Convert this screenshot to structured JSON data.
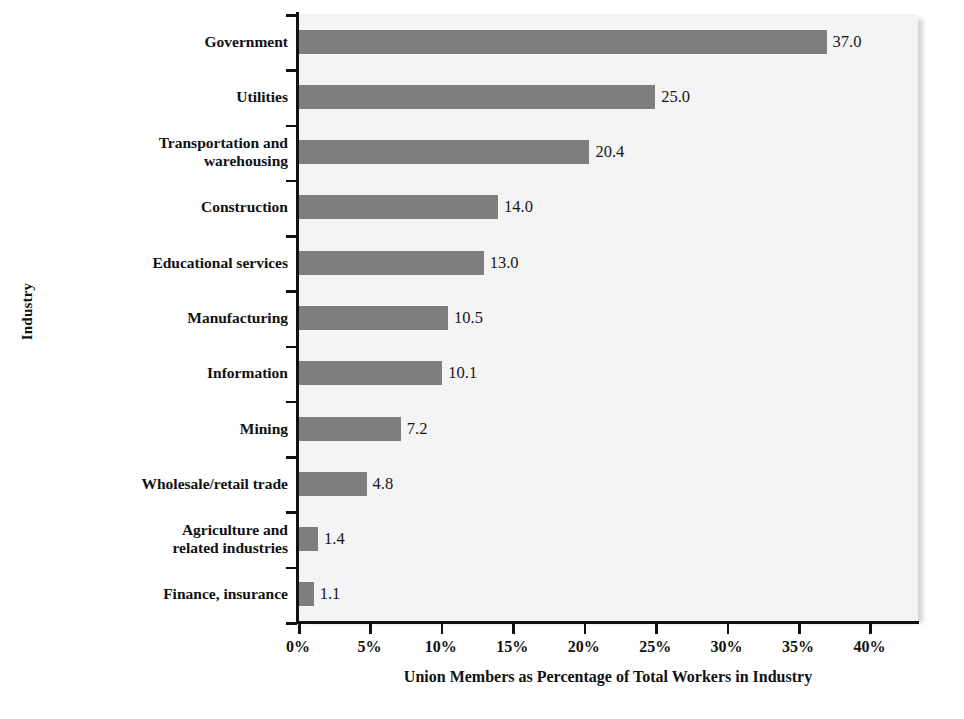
{
  "chart_data": {
    "type": "bar",
    "orientation": "horizontal",
    "title": "",
    "xlabel": "Union Members as Percentage of Total Workers in Industry",
    "ylabel": "Industry",
    "categories": [
      "Government",
      "Utilities",
      "Transportation and warehousing",
      "Construction",
      "Educational services",
      "Manufacturing",
      "Information",
      "Mining",
      "Wholesale/retail trade",
      "Agriculture and related industries",
      "Finance, insurance"
    ],
    "category_lines": [
      [
        "Government"
      ],
      [
        "Utilities"
      ],
      [
        "Transportation and",
        "warehousing"
      ],
      [
        "Construction"
      ],
      [
        "Educational services"
      ],
      [
        "Manufacturing"
      ],
      [
        "Information"
      ],
      [
        "Mining"
      ],
      [
        "Wholesale/retail trade"
      ],
      [
        "Agriculture and",
        "related industries"
      ],
      [
        "Finance, insurance"
      ]
    ],
    "values": [
      37.0,
      25.0,
      20.4,
      14.0,
      13.0,
      10.5,
      10.1,
      7.2,
      4.8,
      1.4,
      1.1
    ],
    "value_labels": [
      "37.0",
      "25.0",
      "20.4",
      "14.0",
      "13.0",
      "10.5",
      "10.1",
      "7.2",
      "4.8",
      "1.4",
      "1.1"
    ],
    "xlim": [
      0,
      43.4
    ],
    "xticks": [
      0,
      5,
      10,
      15,
      20,
      25,
      30,
      35,
      40
    ],
    "xtick_labels": [
      "0%",
      "5%",
      "10%",
      "15%",
      "20%",
      "25%",
      "30%",
      "35%",
      "40%"
    ],
    "grid": false,
    "legend": null,
    "bar_color": "#7e7e7e",
    "plot_background": "#f4f4f4",
    "axis_color": "#111111",
    "value_label_color": "#151515"
  }
}
